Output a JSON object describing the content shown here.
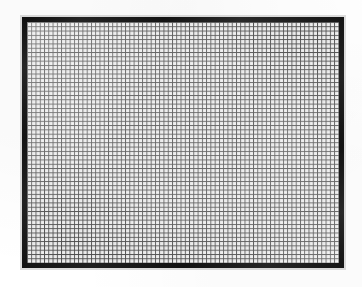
{
  "image": {
    "subject": "fine wire mesh grid panel",
    "width": 362,
    "height": 287,
    "background_color": "#ffffff",
    "rendering": "scanned halftone, grayscale"
  },
  "panel": {
    "label": "mesh-panel",
    "x": 22,
    "y": 17,
    "width": 322,
    "height": 251,
    "frame_color": "#191919",
    "frame_thickness_px": 5,
    "interior_color": "#ffffff"
  },
  "mesh": {
    "label": "fine square grid",
    "columns": 73,
    "rows": 56,
    "cell_width_px": 4.27,
    "cell_height_px": 4.3,
    "line_color": "#4a4a4a",
    "line_width_px": 1,
    "cell_fill_color": "#ffffff",
    "orientation": "orthogonal"
  },
  "frame_edges": [
    {
      "name": "top",
      "color": "#191919"
    },
    {
      "name": "right",
      "color": "#191919"
    },
    {
      "name": "bottom",
      "color": "#191919"
    },
    {
      "name": "left",
      "color": "#191919"
    }
  ]
}
